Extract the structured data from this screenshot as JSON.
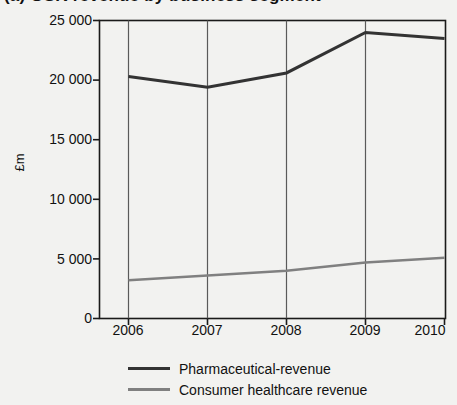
{
  "chart_data": {
    "type": "line",
    "title": "(a) GSK revenue by business segment",
    "title_clipped": true,
    "xlabel": "",
    "ylabel": "£m",
    "categories": [
      "2006",
      "2007",
      "2008",
      "2009",
      "2010"
    ],
    "x": [
      2006,
      2007,
      2008,
      2009,
      2010
    ],
    "xlim": [
      2005.5,
      2010.5
    ],
    "ylim": [
      0,
      25000
    ],
    "yticks": [
      0,
      5000,
      10000,
      15000,
      20000,
      25000
    ],
    "ytick_labels": [
      "0",
      "5 000",
      "10 000",
      "15 000",
      "20 000",
      "25 000"
    ],
    "grid": "vertical",
    "legend_position": "bottom",
    "series": [
      {
        "name": "Pharmaceutical-revenue",
        "color": "#333333",
        "width": 3,
        "values": [
          20300,
          19400,
          20600,
          24000,
          23500
        ]
      },
      {
        "name": "Consumer healthcare revenue",
        "color": "#808080",
        "width": 2.5,
        "values": [
          3200,
          3600,
          4000,
          4700,
          5100
        ]
      }
    ]
  },
  "legend": {
    "items": [
      {
        "label": "Pharmaceutical-revenue",
        "color": "#333333",
        "thickness": "3px"
      },
      {
        "label": "Consumer healthcare revenue",
        "color": "#808080",
        "thickness": "3px"
      }
    ]
  },
  "axis": {
    "y_label": "£m",
    "y_ticks": [
      "25 000",
      "20 000",
      "15 000",
      "10 000",
      "5 000",
      "0"
    ],
    "x_ticks": [
      "2006",
      "2007",
      "2008",
      "2009",
      "2010"
    ]
  },
  "colors": {
    "background": "#f2f2f0",
    "axis": "#1a1a1a",
    "gridline": "#5a5a5a",
    "series_primary": "#333333",
    "series_secondary": "#808080"
  }
}
